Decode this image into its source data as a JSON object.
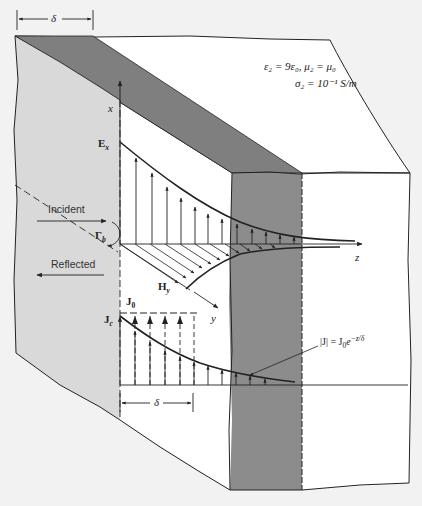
{
  "figure": {
    "colors": {
      "background": "#f2f2f2",
      "block_face": "#ffffff",
      "left_face": "#d8d8d8",
      "dark_band": "#8c8c8c",
      "line": "#222222"
    },
    "labels": {
      "delta_top": "δ",
      "delta_bottom": "δ",
      "medium_line1": "ε₂ = 9ε₀, μ₂ = μ₀",
      "medium_line2": "σ₂ = 10⁻¹ S/m",
      "x_axis": "x",
      "z_axis": "z",
      "y_axis": "y",
      "Ex": "E",
      "Ex_sub": "x",
      "Hy": "H",
      "Hy_sub": "y",
      "J0": "J",
      "J0_sub": "0",
      "Jc": "J",
      "Jc_sub": "c",
      "gamma": "Γ",
      "gamma_sub": "b",
      "incident": "Incident",
      "reflected": "Reflected",
      "J_eq_lhs": "|J| = J",
      "J_eq_sub": "0",
      "J_eq_exp_base": "e",
      "J_eq_exp": "−z/δ"
    }
  }
}
